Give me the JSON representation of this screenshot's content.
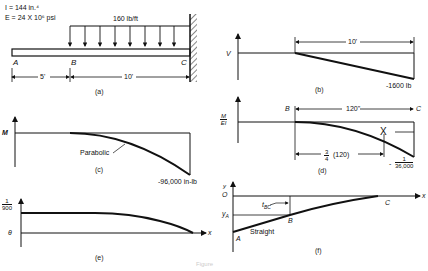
{
  "figure": {
    "caption": "Figure",
    "panels": {
      "a": {
        "label": "(a)",
        "props": {
          "I": "I = 144 in.⁴",
          "E": "E = 24 X 10⁶ psi"
        },
        "load": "160 lb/ft",
        "points": [
          "A",
          "B",
          "C"
        ],
        "dims": [
          "5'",
          "10'"
        ]
      },
      "b": {
        "label": "(b)",
        "axis": "V",
        "span": "10'",
        "end_value": "-1600 lb"
      },
      "c": {
        "label": "(c)",
        "axis": "M",
        "curve_note": "Parabolic",
        "end_value": "-96,000 in-lb"
      },
      "d": {
        "label": "(d)",
        "axis_num": "M",
        "axis_den": "EI",
        "points": [
          "B",
          "C"
        ],
        "span": "120\"",
        "centroid_mark": "X",
        "centroid_dim_num": "3",
        "centroid_dim_den": "4",
        "centroid_dim_text": "(120)",
        "end_num": "1",
        "end_den": "36,000",
        "end_sign": "-"
      },
      "e": {
        "label": "(e)",
        "axis": "θ",
        "x_axis": "x",
        "value_num": "1",
        "value_den": "900"
      },
      "f": {
        "label": "(f)",
        "axis": "y",
        "origin": "O",
        "x_axis": "x",
        "yA": "y",
        "yA_sub": "A",
        "tBC": "t",
        "tBC_sub": "BC",
        "points": [
          "A",
          "B",
          "C"
        ],
        "note": "Straight"
      }
    }
  }
}
